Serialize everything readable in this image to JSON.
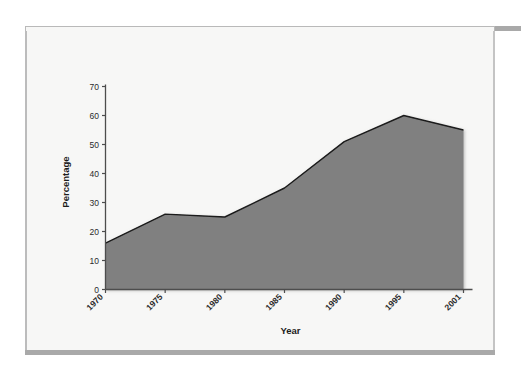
{
  "figure": {
    "background_color": "#f7f7f6",
    "frame_bar_color": "#a9a9a9",
    "frame_border_color": "#b9b9b9"
  },
  "chart_data": {
    "type": "area",
    "title": "",
    "subtitle": "",
    "xlabel": "Year",
    "ylabel": "Percentage",
    "categories": [
      "1970",
      "1975",
      "1980",
      "1985",
      "1990",
      "1995",
      "2001"
    ],
    "x": [
      1970,
      1975,
      1980,
      1985,
      1990,
      1995,
      2001
    ],
    "values": [
      16,
      26,
      25,
      35,
      51,
      60,
      55
    ],
    "series": [
      {
        "name": "Percentage",
        "values": [
          16,
          26,
          25,
          35,
          51,
          60,
          55
        ]
      }
    ],
    "ylim": [
      0,
      70
    ],
    "yticks": [
      0,
      10,
      20,
      30,
      40,
      50,
      60,
      70
    ],
    "ytick_labels": [
      "0",
      "10",
      "20",
      "30",
      "40",
      "50",
      "60",
      "70"
    ],
    "xtick_labels": [
      "1970",
      "1975",
      "1980",
      "1985",
      "1990",
      "1995",
      "2001"
    ],
    "xtick_rotation": -45,
    "grid": false,
    "legend": false,
    "legend_position": "none",
    "area_fill_color": "#808080",
    "line_color": "#1a1a1a",
    "axis_color": "#4d4d4d",
    "annotations": []
  }
}
